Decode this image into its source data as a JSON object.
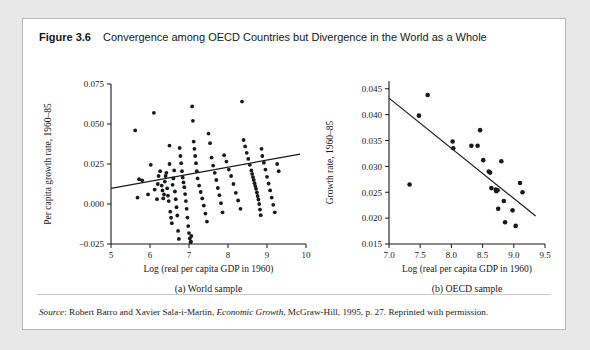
{
  "figure": {
    "number": "Figure 3.6",
    "title": "Convergence among OECD Countries but Divergence in the World as a Whole",
    "source_prefix": "Source",
    "source_text": ": Robert Barro and Xavier Sala-i-Martin, ",
    "source_italic_work": "Economic Growth",
    "source_suffix": ", McGraw-Hill, 1995, p. 27. Reprinted with permission."
  },
  "colors": {
    "page_background": "#e8e8e8",
    "card_background": "#ffffff",
    "card_border": "#b9b9b9",
    "axis": "#16191c",
    "point": "#17191b",
    "fit_line": "#17191b",
    "text": "#14181d"
  },
  "chart_data": [
    {
      "type": "scatter",
      "id": "world-sample",
      "caption": "(a) World sample",
      "title": "",
      "xlabel": "Log (real per capita GDP in 1960)",
      "ylabel": "Per capita growth rate, 1960–85",
      "xlim": [
        5,
        10
      ],
      "ylim": [
        -0.025,
        0.075
      ],
      "xticks": [
        5,
        6,
        7,
        8,
        9,
        10
      ],
      "xticklabels": [
        "5",
        "6",
        "7",
        "8",
        "9",
        "10"
      ],
      "yticks": [
        -0.025,
        0.0,
        0.025,
        0.05,
        0.075
      ],
      "yticklabels": [
        "−0.025",
        "0.000",
        "0.025",
        "0.050",
        "0.075"
      ],
      "grid": false,
      "legend": "none",
      "fit_line": {
        "x": [
          5.0,
          9.85
        ],
        "y": [
          0.0098,
          0.0312
        ]
      },
      "x": [
        5.62,
        5.68,
        5.72,
        5.8,
        5.95,
        6.02,
        6.1,
        6.12,
        6.18,
        6.2,
        6.22,
        6.26,
        6.3,
        6.32,
        6.34,
        6.36,
        6.38,
        6.4,
        6.42,
        6.44,
        6.46,
        6.48,
        6.5,
        6.5,
        6.52,
        6.54,
        6.56,
        6.58,
        6.6,
        6.62,
        6.64,
        6.66,
        6.68,
        6.7,
        6.72,
        6.74,
        6.76,
        6.78,
        6.8,
        6.82,
        6.84,
        6.86,
        6.88,
        6.9,
        6.92,
        6.94,
        6.96,
        6.98,
        7.0,
        7.02,
        7.04,
        7.05,
        7.06,
        7.08,
        7.1,
        7.12,
        7.14,
        7.16,
        7.18,
        7.2,
        7.22,
        7.26,
        7.3,
        7.34,
        7.38,
        7.42,
        7.46,
        7.5,
        7.54,
        7.58,
        7.62,
        7.66,
        7.7,
        7.74,
        7.78,
        7.82,
        7.86,
        7.9,
        7.96,
        8.02,
        8.08,
        8.14,
        8.2,
        8.26,
        8.32,
        8.36,
        8.4,
        8.44,
        8.48,
        8.52,
        8.56,
        8.6,
        8.62,
        8.64,
        8.66,
        8.68,
        8.7,
        8.72,
        8.74,
        8.76,
        8.78,
        8.8,
        8.82,
        8.84,
        8.86,
        8.88,
        8.92,
        8.96,
        9.0,
        9.04,
        9.08,
        9.12,
        9.16,
        9.2,
        9.26,
        9.3
      ],
      "y": [
        0.046,
        0.004,
        0.0155,
        0.0148,
        0.006,
        0.0245,
        0.057,
        0.009,
        0.003,
        0.0125,
        0.0175,
        0.0205,
        0.0115,
        0.0085,
        0.0035,
        0.006,
        0.014,
        0.0175,
        0.0195,
        0.0098,
        0.0052,
        0.0018,
        0.025,
        0.0365,
        -0.0048,
        -0.0086,
        -0.012,
        0.012,
        0.016,
        0.021,
        0.0078,
        0.003,
        -0.002,
        -0.0072,
        -0.0168,
        -0.0218,
        0.035,
        0.03,
        0.0255,
        0.0205,
        0.0165,
        0.0135,
        0.0105,
        0.0062,
        0.0018,
        -0.003,
        -0.0085,
        -0.0138,
        -0.0182,
        -0.0215,
        -0.0238,
        -0.0236,
        -0.02,
        0.061,
        0.052,
        0.039,
        0.0345,
        0.03,
        0.0255,
        0.0205,
        0.016,
        0.0115,
        0.0075,
        0.0035,
        -0.001,
        -0.006,
        -0.011,
        0.044,
        0.038,
        0.029,
        0.024,
        0.0195,
        0.015,
        0.01,
        0.0055,
        0.0005,
        -0.0052,
        0.0305,
        0.0265,
        0.0215,
        0.0175,
        0.0125,
        0.007,
        0.0022,
        -0.003,
        0.064,
        0.04,
        0.036,
        0.032,
        0.0282,
        0.0245,
        0.021,
        0.0188,
        0.0168,
        0.015,
        0.013,
        0.0112,
        0.0095,
        0.0072,
        0.005,
        0.0028,
        0.0,
        -0.0035,
        -0.007,
        0.0345,
        0.03,
        0.0258,
        0.0215,
        0.017,
        0.0128,
        0.0085,
        0.004,
        -0.0005,
        -0.0052,
        0.025,
        0.0205
      ]
    },
    {
      "type": "scatter",
      "id": "oecd-sample",
      "caption": "(b) OECD sample",
      "title": "",
      "xlabel": "Log (real per capita GDP in 1960)",
      "ylabel": "Growth rate, 1960–85",
      "xlim": [
        7.0,
        9.5
      ],
      "ylim": [
        0.015,
        0.0465
      ],
      "xticks": [
        7.0,
        7.5,
        8.0,
        8.5,
        9.0,
        9.5
      ],
      "xticklabels": [
        "7.0",
        "7.5",
        "8.0",
        "8.5",
        "9.0",
        "9.5"
      ],
      "yticks": [
        0.015,
        0.02,
        0.025,
        0.03,
        0.035,
        0.04,
        0.045
      ],
      "yticklabels": [
        "0.015",
        "0.020",
        "0.025",
        "0.030",
        "0.035",
        "0.040",
        "0.045"
      ],
      "grid": false,
      "legend": "none",
      "fit_line": {
        "x": [
          7.0,
          9.35
        ],
        "y": [
          0.0432,
          0.0204
        ]
      },
      "x": [
        7.33,
        7.48,
        7.62,
        8.02,
        8.03,
        8.32,
        8.42,
        8.46,
        8.51,
        8.6,
        8.62,
        8.64,
        8.71,
        8.72,
        8.74,
        8.75,
        8.8,
        8.84,
        8.86,
        8.98,
        9.03,
        9.1,
        9.14
      ],
      "y": [
        0.0265,
        0.0398,
        0.0438,
        0.0348,
        0.0335,
        0.034,
        0.034,
        0.037,
        0.0312,
        0.029,
        0.0288,
        0.0258,
        0.0255,
        0.0252,
        0.0254,
        0.0218,
        0.031,
        0.0233,
        0.0192,
        0.0215,
        0.0185,
        0.0268,
        0.025
      ]
    }
  ]
}
